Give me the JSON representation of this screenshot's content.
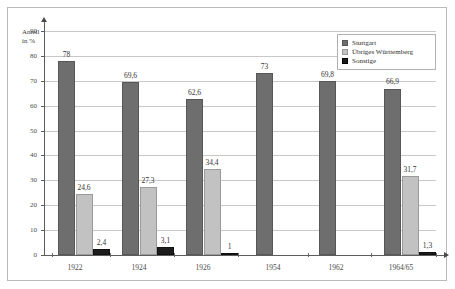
{
  "chart_data": {
    "type": "bar",
    "title": "",
    "subtitle": "",
    "xlabel": "",
    "ylabel": "Anteil\nin %",
    "ylabel_lines": [
      "Anteil",
      "in %"
    ],
    "categories": [
      "1922",
      "1924",
      "1926",
      "1954",
      "1962",
      "1964/65"
    ],
    "series": [
      {
        "name": "Stuttgart",
        "color": "#6e6e6e",
        "values": [
          78,
          69.6,
          62.6,
          73,
          69.8,
          66.9
        ],
        "labels": [
          "78",
          "69,6",
          "62,6",
          "73",
          "69,8",
          "66,9"
        ]
      },
      {
        "name": "Übriges Württemberg",
        "color": "#c2c2c2",
        "values": [
          24.6,
          27.3,
          34.4,
          null,
          null,
          31.7
        ],
        "labels": [
          "24,6",
          "27,3",
          "34,4",
          "",
          "",
          "31,7"
        ]
      },
      {
        "name": "Sonstige",
        "color": "#1c1c1c",
        "values": [
          2.4,
          3.1,
          1,
          null,
          null,
          1.3
        ],
        "labels": [
          "2,4",
          "3,1",
          "1",
          "",
          "",
          "1,3"
        ]
      }
    ],
    "ylim": [
      0,
      90
    ],
    "yticks": [
      0,
      10,
      20,
      30,
      40,
      50,
      60,
      70,
      80,
      90
    ],
    "ytick_labels": [
      "0",
      "10",
      "20",
      "30",
      "40",
      "50",
      "60",
      "70",
      "80",
      "90"
    ],
    "grid": true,
    "grid_axis": "y",
    "legend_position": "top-right",
    "legend_entries": [
      "Stuttgart",
      "Übriges Württemberg",
      "Sonstige"
    ]
  },
  "legend": {
    "items": [
      {
        "label": "Stuttgart",
        "swatch": "legend-swatch-stuttgart"
      },
      {
        "label": "Übriges Württemberg",
        "swatch": "legend-swatch-uebriges-wuerttemberg"
      },
      {
        "label": "Sonstige",
        "swatch": "legend-swatch-sonstige"
      }
    ]
  },
  "axes": {
    "y_title_line1": "Anteil",
    "y_title_line2": "in %"
  }
}
